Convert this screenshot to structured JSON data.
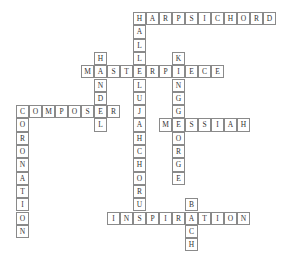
{
  "puzzle": {
    "type": "crossword",
    "origin_x": 16,
    "origin_y": 12,
    "cell_w": 13,
    "cell_h": 13.3,
    "words": [
      {
        "answer": "HARPSICHORD",
        "dir": "across",
        "row": 0,
        "col": 9
      },
      {
        "answer": "HALLELUJAHCHORUS",
        "dir": "down",
        "row": 0,
        "col": 9
      },
      {
        "answer": "HANDEL",
        "dir": "down",
        "row": 3,
        "col": 6
      },
      {
        "answer": "KINGGEORGE",
        "dir": "down",
        "row": 3,
        "col": 12
      },
      {
        "answer": "MASTERPIECE",
        "dir": "across",
        "row": 4,
        "col": 5
      },
      {
        "answer": "COMPOSER",
        "dir": "across",
        "row": 7,
        "col": 0
      },
      {
        "answer": "CORONATION",
        "dir": "down",
        "row": 7,
        "col": 0
      },
      {
        "answer": "MESSIAH",
        "dir": "across",
        "row": 8,
        "col": 11
      },
      {
        "answer": "BACH",
        "dir": "down",
        "row": 14,
        "col": 13
      },
      {
        "answer": "INSPIRATION",
        "dir": "across",
        "row": 15,
        "col": 7
      }
    ]
  }
}
